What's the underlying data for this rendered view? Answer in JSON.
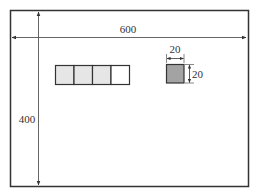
{
  "diagram": {
    "outer_rect": {
      "width_label": "600",
      "height_label": "400"
    },
    "cell_row": {
      "cells": [
        {
          "fill": "#e6e6e6"
        },
        {
          "fill": "#e6e6e6"
        },
        {
          "fill": "#e6e6e6"
        },
        {
          "fill": "#ffffff"
        }
      ]
    },
    "small_square": {
      "fill": "#a3a3a3",
      "width_label": "20",
      "height_label": "20"
    },
    "colors": {
      "stroke": "#333333",
      "dim_line": "#555555",
      "background": "#ffffff"
    }
  }
}
